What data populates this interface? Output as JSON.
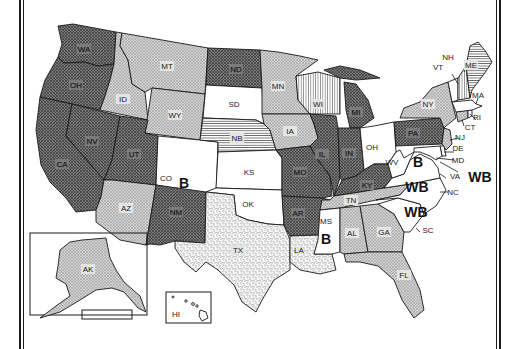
{
  "map": {
    "title": "",
    "pattern_legend": {
      "dark": "dark crosshatch",
      "light": "light crosshatch",
      "white": "no fill",
      "hstripe": "horizontal stripes",
      "vstripe": "vertical stripes",
      "dotted": "stippled"
    },
    "colors": {
      "dark": "#6e6e6e",
      "light": "#c4c4c4",
      "white": "#ffffff",
      "stroke": "#1a1a1a"
    },
    "states": [
      {
        "code": "WA",
        "fill": "dark"
      },
      {
        "code": "OR",
        "label": "OR",
        "fill": "dark"
      },
      {
        "code": "CA",
        "fill": "dark"
      },
      {
        "code": "NV",
        "fill": "dark"
      },
      {
        "code": "ID",
        "fill": "light"
      },
      {
        "code": "MT",
        "fill": "light"
      },
      {
        "code": "WY",
        "fill": "light"
      },
      {
        "code": "UT",
        "fill": "dark"
      },
      {
        "code": "AZ",
        "fill": "light"
      },
      {
        "code": "CO",
        "fill": "white",
        "annotation": "B"
      },
      {
        "code": "NM",
        "fill": "dark"
      },
      {
        "code": "ND",
        "fill": "dark"
      },
      {
        "code": "SD",
        "fill": "white"
      },
      {
        "code": "NB",
        "fill": "hstripe"
      },
      {
        "code": "KS",
        "fill": "white"
      },
      {
        "code": "OK",
        "fill": "white"
      },
      {
        "code": "TX",
        "fill": "dotted"
      },
      {
        "code": "MN",
        "fill": "light"
      },
      {
        "code": "IA",
        "fill": "light"
      },
      {
        "code": "MO",
        "fill": "dark"
      },
      {
        "code": "AR",
        "fill": "dark"
      },
      {
        "code": "LA",
        "fill": "dotted"
      },
      {
        "code": "WI",
        "fill": "vstripe"
      },
      {
        "code": "IL",
        "fill": "dark"
      },
      {
        "code": "MI",
        "fill": "dark"
      },
      {
        "code": "IN",
        "fill": "dark"
      },
      {
        "code": "OH",
        "fill": "white"
      },
      {
        "code": "KY",
        "fill": "dark"
      },
      {
        "code": "TN",
        "fill": "light"
      },
      {
        "code": "MS",
        "fill": "white",
        "annotation": "B"
      },
      {
        "code": "AL",
        "fill": "light"
      },
      {
        "code": "GA",
        "fill": "light"
      },
      {
        "code": "FL",
        "fill": "light"
      },
      {
        "code": "SC",
        "fill": "white",
        "annotation": "WB"
      },
      {
        "code": "NC",
        "fill": "white",
        "annotation": "WB"
      },
      {
        "code": "VA",
        "fill": "white",
        "annotation": "WB"
      },
      {
        "code": "WV",
        "fill": "white",
        "annotation": "B"
      },
      {
        "code": "PA",
        "fill": "dark"
      },
      {
        "code": "NY",
        "fill": "light"
      },
      {
        "code": "NJ",
        "fill": "light"
      },
      {
        "code": "DE",
        "fill": "white"
      },
      {
        "code": "MD",
        "fill": "white"
      },
      {
        "code": "CT",
        "fill": "light"
      },
      {
        "code": "RI",
        "fill": "white"
      },
      {
        "code": "MA",
        "fill": "white"
      },
      {
        "code": "VT",
        "fill": "white"
      },
      {
        "code": "NH",
        "fill": "vstripe"
      },
      {
        "code": "ME",
        "fill": "hstripe"
      },
      {
        "code": "AK",
        "fill": "light"
      },
      {
        "code": "HI",
        "fill": "white"
      }
    ],
    "labels": {
      "WA": "WA",
      "OR": "OH",
      "CA": "CA",
      "NV": "NV",
      "ID": "ID",
      "MT": "MT",
      "WY": "WY",
      "UT": "UT",
      "AZ": "AZ",
      "CO": "CO",
      "NM": "NM",
      "ND": "ND",
      "SD": "SD",
      "NB": "NB",
      "KS": "KS",
      "OK": "OK",
      "TX": "TX",
      "MN": "MN",
      "IA": "IA",
      "MO": "MO",
      "AR": "AR",
      "LA": "LA",
      "WI": "WI",
      "IL": "IL",
      "MI": "MI",
      "IN": "IN",
      "OH": "OH",
      "KY": "KY",
      "TN": "TN",
      "MS": "MS",
      "AL": "AL",
      "GA": "GA",
      "FL": "FL",
      "SC": "SC",
      "NC": "NC",
      "VA": "VA",
      "WV": "WV",
      "PA": "PA",
      "NY": "NY",
      "NJ": "NJ",
      "DE": "DE",
      "MD": "MD",
      "CT": "CT",
      "RI": "RI",
      "MA": "MA",
      "VT": "VT",
      "NH": "NH",
      "ME": "ME",
      "AK": "AK",
      "HI": "HI"
    },
    "annotations": {
      "CO": "B",
      "WV": "B",
      "MS": "B",
      "VA": "WB",
      "NC": "WB",
      "SC": "WB"
    }
  }
}
